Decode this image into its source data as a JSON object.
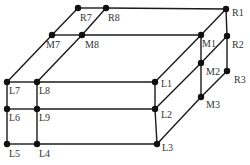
{
  "diagram": {
    "type": "3d-box-node-grid",
    "colors": {
      "edge": "#1a1a1a",
      "node": "#111111",
      "label": "#333333",
      "background": "#ffffff"
    },
    "nodes": [
      {
        "id": "R7",
        "x": 78,
        "y": 8,
        "lx": 80,
        "ly": 21
      },
      {
        "id": "R8",
        "x": 106,
        "y": 8,
        "lx": 108,
        "ly": 21
      },
      {
        "id": "R1",
        "x": 226,
        "y": 9,
        "lx": 232,
        "ly": 16
      },
      {
        "id": "M7",
        "x": 52,
        "y": 35,
        "lx": 46,
        "ly": 48
      },
      {
        "id": "M8",
        "x": 82,
        "y": 35,
        "lx": 85,
        "ly": 48
      },
      {
        "id": "M1",
        "x": 201,
        "y": 35,
        "lx": 202,
        "ly": 47
      },
      {
        "id": "R2",
        "x": 227,
        "y": 36,
        "lx": 232,
        "ly": 48
      },
      {
        "id": "M2",
        "x": 201,
        "y": 63,
        "lx": 206,
        "ly": 75
      },
      {
        "id": "R3",
        "x": 227,
        "y": 71,
        "lx": 234,
        "ly": 83
      },
      {
        "id": "M3",
        "x": 201,
        "y": 97,
        "lx": 206,
        "ly": 108
      },
      {
        "id": "L7",
        "x": 7,
        "y": 82,
        "lx": 9,
        "ly": 94
      },
      {
        "id": "L8",
        "x": 37,
        "y": 82,
        "lx": 39,
        "ly": 94
      },
      {
        "id": "L1",
        "x": 155,
        "y": 82,
        "lx": 161,
        "ly": 87
      },
      {
        "id": "L6",
        "x": 7,
        "y": 109,
        "lx": 9,
        "ly": 121
      },
      {
        "id": "L9",
        "x": 37,
        "y": 109,
        "lx": 39,
        "ly": 121
      },
      {
        "id": "L2",
        "x": 155,
        "y": 109,
        "lx": 161,
        "ly": 118
      },
      {
        "id": "L5",
        "x": 7,
        "y": 144,
        "lx": 9,
        "ly": 157
      },
      {
        "id": "L4",
        "x": 37,
        "y": 144,
        "lx": 39,
        "ly": 157
      },
      {
        "id": "L3",
        "x": 157,
        "y": 144,
        "lx": 162,
        "ly": 151
      }
    ],
    "edges": [
      [
        "R7",
        "R8"
      ],
      [
        "R8",
        "R1"
      ],
      [
        "M7",
        "M8"
      ],
      [
        "M8",
        "M1"
      ],
      [
        "L7",
        "L8"
      ],
      [
        "L8",
        "L1"
      ],
      [
        "L6",
        "L9"
      ],
      [
        "L9",
        "L2"
      ],
      [
        "L5",
        "L4"
      ],
      [
        "L4",
        "L3"
      ],
      [
        "L7",
        "M7"
      ],
      [
        "M7",
        "R7"
      ],
      [
        "L8",
        "M8"
      ],
      [
        "M8",
        "R8"
      ],
      [
        "L1",
        "M1"
      ],
      [
        "M1",
        "R1"
      ],
      [
        "L2",
        "M2"
      ],
      [
        "M2",
        "R2"
      ],
      [
        "L3",
        "M3"
      ],
      [
        "M3",
        "R3"
      ],
      [
        "L7",
        "L6"
      ],
      [
        "L6",
        "L5"
      ],
      [
        "L8",
        "L9"
      ],
      [
        "L9",
        "L4"
      ],
      [
        "L1",
        "L2"
      ],
      [
        "L2",
        "L3"
      ],
      [
        "M1",
        "M2"
      ],
      [
        "M2",
        "M3"
      ],
      [
        "R1",
        "R2"
      ],
      [
        "R2",
        "R3"
      ]
    ]
  }
}
